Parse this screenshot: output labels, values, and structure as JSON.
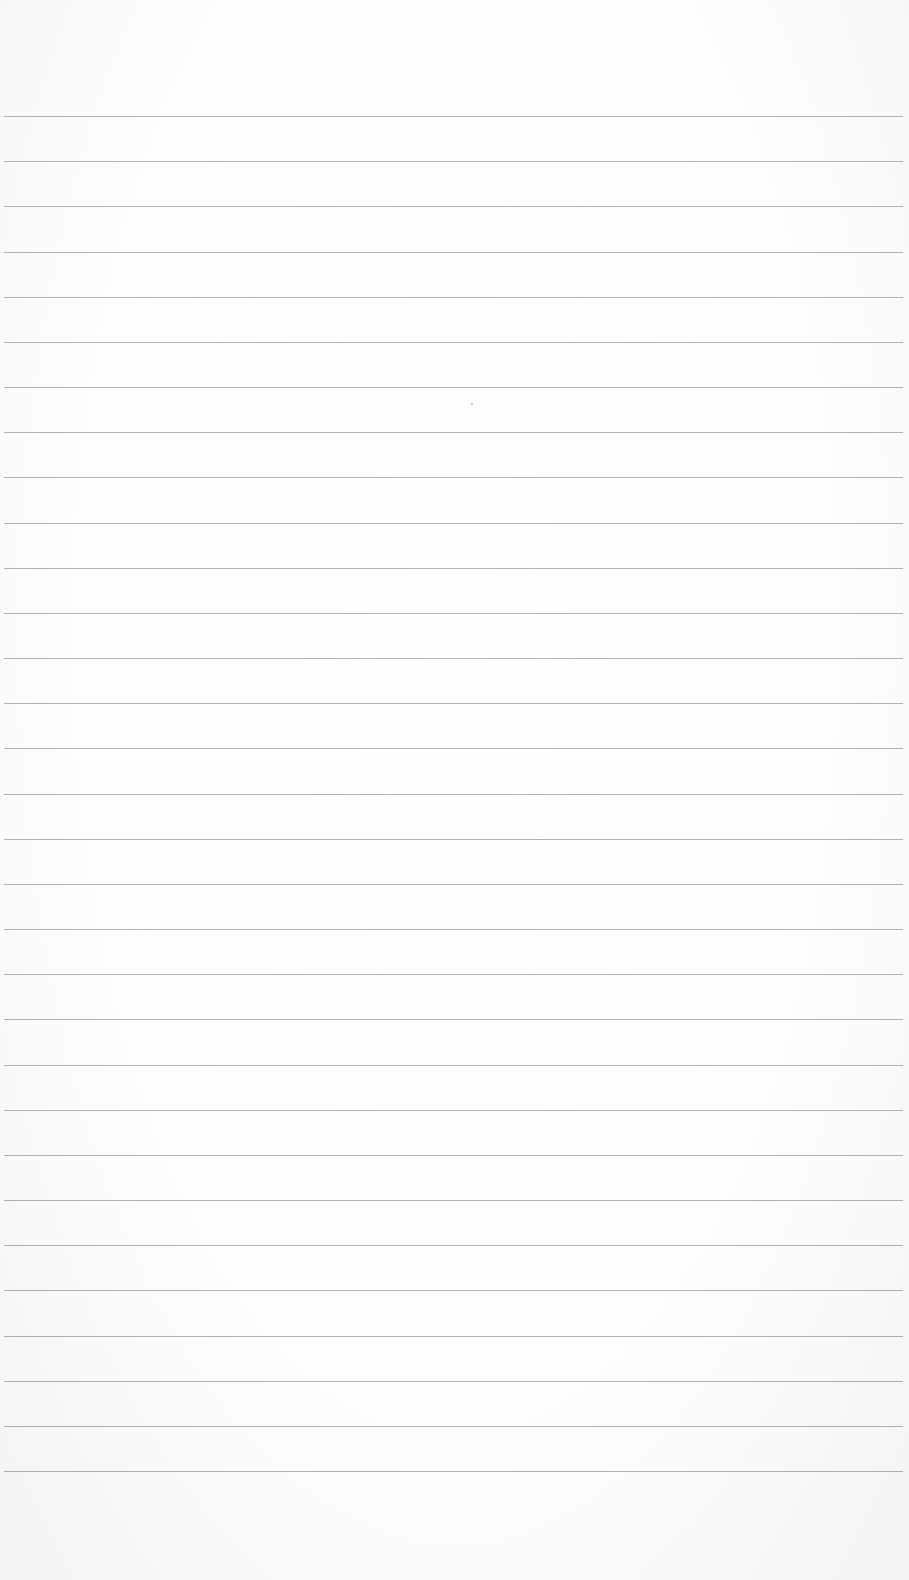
{
  "page": {
    "type": "lined-paper",
    "background_color": "#fdfdfd",
    "rule_color": "#9a9a9a",
    "rule_count": 31,
    "first_rule_y": 116,
    "rule_spacing": 45.17,
    "rule_left": 4,
    "rule_right": 903
  }
}
